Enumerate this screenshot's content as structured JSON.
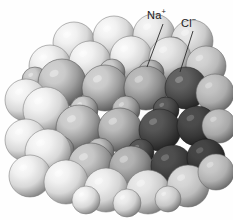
{
  "figure": {
    "background_color": "#fefefe",
    "width": 233,
    "height": 220
  },
  "labels": [
    {
      "id": "na",
      "species": "Na",
      "charge": "+",
      "text": "Na",
      "charge_text": "+",
      "full_text": "Na+",
      "x": 147,
      "y": 9,
      "leader_line": {
        "x1": 163,
        "y1": 24,
        "x2": 147,
        "y2": 67
      }
    },
    {
      "id": "cl",
      "species": "Cl",
      "charge": "−",
      "text": "Cl",
      "charge_text": "−",
      "full_text": "Cl−",
      "x": 181,
      "y": 17,
      "leader_line": {
        "x1": 193,
        "y1": 31,
        "x2": 180,
        "y2": 72
      }
    }
  ],
  "ion_styles": {
    "chloride": {
      "name": "Cl-",
      "role": "anion",
      "relative_radius": 1.0,
      "light_hex": "#fbfbfb",
      "mid_hex": "#d8d8d8",
      "dark_hex": "#9d9d9d",
      "edge_hex": "#8a8a8a"
    },
    "sodium": {
      "name": "Na+",
      "role": "cation",
      "relative_radius": 0.62,
      "light_hex": "#d2d2d2",
      "mid_hex": "#9e9e9e",
      "dark_hex": "#6d6d6d",
      "edge_hex": "#5c5c5c"
    },
    "shadow_face": {
      "name": "shaded-right-face",
      "light_hex": "#9a9a9a",
      "mid_hex": "#6f6f6f",
      "dark_hex": "#474747",
      "edge_hex": "#3a3a3a"
    }
  },
  "lattice": {
    "structure": "rock-salt (face-centered cubic)",
    "description": "Alternating large pale chloride ions and smaller darker sodium ions packed in a cube.",
    "columns": 4,
    "rows": 4,
    "layers": 3,
    "leader_line_color": "#2a2a2a",
    "leader_line_width": 0.9
  },
  "spheres": [
    {
      "cx": 74,
      "cy": 43,
      "r": 21,
      "ion": "chloride",
      "lit": 1.0
    },
    {
      "cx": 114,
      "cy": 37,
      "r": 21,
      "ion": "chloride",
      "lit": 1.0
    },
    {
      "cx": 154,
      "cy": 35,
      "r": 21,
      "ion": "chloride",
      "lit": 0.98
    },
    {
      "cx": 192,
      "cy": 41,
      "r": 21,
      "ion": "chloride",
      "lit": 0.94
    },
    {
      "cx": 95,
      "cy": 56,
      "r": 13,
      "ion": "sodium",
      "lit": 1.0
    },
    {
      "cx": 134,
      "cy": 50,
      "r": 13,
      "ion": "sodium",
      "lit": 1.0
    },
    {
      "cx": 173,
      "cy": 50,
      "r": 13,
      "ion": "sodium",
      "lit": 0.96
    },
    {
      "cx": 50,
      "cy": 66,
      "r": 21,
      "ion": "chloride",
      "lit": 1.0
    },
    {
      "cx": 90,
      "cy": 62,
      "r": 21,
      "ion": "chloride",
      "lit": 1.0
    },
    {
      "cx": 131,
      "cy": 57,
      "r": 21,
      "ion": "chloride",
      "lit": 1.0
    },
    {
      "cx": 170,
      "cy": 58,
      "r": 21,
      "ion": "chloride",
      "lit": 0.95
    },
    {
      "cx": 206,
      "cy": 66,
      "r": 20,
      "ion": "chloride",
      "lit": 0.86
    },
    {
      "cx": 35,
      "cy": 80,
      "r": 13,
      "ion": "sodium",
      "lit": 1.0
    },
    {
      "cx": 70,
      "cy": 77,
      "r": 13,
      "ion": "sodium",
      "lit": 1.0
    },
    {
      "cx": 112,
      "cy": 72,
      "r": 13,
      "ion": "sodium",
      "lit": 1.0
    },
    {
      "cx": 151,
      "cy": 73,
      "r": 13,
      "ion": "sodium",
      "lit": 0.92
    },
    {
      "cx": 62,
      "cy": 83,
      "r": 24,
      "ion": "sodium",
      "lit": 1.0
    },
    {
      "cx": 105,
      "cy": 88,
      "r": 23,
      "ion": "sodium",
      "lit": 1.0
    },
    {
      "cx": 146,
      "cy": 88,
      "r": 22,
      "ion": "sodium",
      "lit": 0.9
    },
    {
      "cx": 186,
      "cy": 88,
      "r": 21,
      "ion": "shadow_face",
      "lit": 0.65
    },
    {
      "cx": 215,
      "cy": 93,
      "r": 19,
      "ion": "chloride",
      "lit": 0.8
    },
    {
      "cx": 26,
      "cy": 100,
      "r": 21,
      "ion": "chloride",
      "lit": 1.0
    },
    {
      "cx": 84,
      "cy": 110,
      "r": 14,
      "ion": "sodium",
      "lit": 1.0
    },
    {
      "cx": 126,
      "cy": 110,
      "r": 14,
      "ion": "sodium",
      "lit": 0.94
    },
    {
      "cx": 166,
      "cy": 110,
      "r": 13,
      "ion": "shadow_face",
      "lit": 0.6
    },
    {
      "cx": 46,
      "cy": 110,
      "r": 23,
      "ion": "chloride",
      "lit": 1.0
    },
    {
      "cx": 79,
      "cy": 128,
      "r": 23,
      "ion": "sodium",
      "lit": 1.0
    },
    {
      "cx": 120,
      "cy": 130,
      "r": 22,
      "ion": "sodium",
      "lit": 0.93
    },
    {
      "cx": 160,
      "cy": 130,
      "r": 21,
      "ion": "shadow_face",
      "lit": 0.58
    },
    {
      "cx": 197,
      "cy": 126,
      "r": 20,
      "ion": "shadow_face",
      "lit": 0.5
    },
    {
      "cx": 219,
      "cy": 126,
      "r": 17,
      "ion": "chloride",
      "lit": 0.78
    },
    {
      "cx": 26,
      "cy": 140,
      "r": 21,
      "ion": "chloride",
      "lit": 1.0
    },
    {
      "cx": 60,
      "cy": 150,
      "r": 14,
      "ion": "sodium",
      "lit": 1.0
    },
    {
      "cx": 100,
      "cy": 152,
      "r": 14,
      "ion": "sodium",
      "lit": 0.95
    },
    {
      "cx": 141,
      "cy": 152,
      "r": 13,
      "ion": "shadow_face",
      "lit": 0.58
    },
    {
      "cx": 48,
      "cy": 152,
      "r": 23,
      "ion": "chloride",
      "lit": 1.0
    },
    {
      "cx": 91,
      "cy": 166,
      "r": 23,
      "ion": "sodium",
      "lit": 0.98
    },
    {
      "cx": 131,
      "cy": 168,
      "r": 22,
      "ion": "sodium",
      "lit": 0.88
    },
    {
      "cx": 172,
      "cy": 166,
      "r": 21,
      "ion": "shadow_face",
      "lit": 0.52
    },
    {
      "cx": 206,
      "cy": 158,
      "r": 19,
      "ion": "shadow_face",
      "lit": 0.46
    },
    {
      "cx": 30,
      "cy": 176,
      "r": 21,
      "ion": "chloride",
      "lit": 1.0
    },
    {
      "cx": 66,
      "cy": 182,
      "r": 22,
      "ion": "chloride",
      "lit": 1.0
    },
    {
      "cx": 106,
      "cy": 190,
      "r": 22,
      "ion": "chloride",
      "lit": 0.98
    },
    {
      "cx": 148,
      "cy": 192,
      "r": 22,
      "ion": "chloride",
      "lit": 0.94
    },
    {
      "cx": 188,
      "cy": 186,
      "r": 21,
      "ion": "chloride",
      "lit": 0.88
    },
    {
      "cx": 216,
      "cy": 172,
      "r": 18,
      "ion": "chloride",
      "lit": 0.82
    },
    {
      "cx": 86,
      "cy": 200,
      "r": 14,
      "ion": "chloride",
      "lit": 1.0
    },
    {
      "cx": 127,
      "cy": 203,
      "r": 14,
      "ion": "chloride",
      "lit": 0.97
    },
    {
      "cx": 168,
      "cy": 199,
      "r": 13,
      "ion": "chloride",
      "lit": 0.92
    }
  ]
}
